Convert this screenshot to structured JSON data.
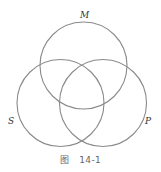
{
  "diagram": {
    "type": "venn",
    "sets": [
      {
        "id": "M",
        "label": "M",
        "cx": 83.5,
        "cy": 65.5,
        "r": 43.5
      },
      {
        "id": "S",
        "label": "S",
        "cx": 60.5,
        "cy": 103,
        "r": 43.5
      },
      {
        "id": "P",
        "label": "P",
        "cx": 103,
        "cy": 103,
        "r": 43.5
      }
    ],
    "stroke_color": "#8a8a8a"
  },
  "labels": {
    "M": "M",
    "S": "S",
    "P": "P"
  },
  "caption": {
    "prefix": "图",
    "number": "14-1"
  }
}
